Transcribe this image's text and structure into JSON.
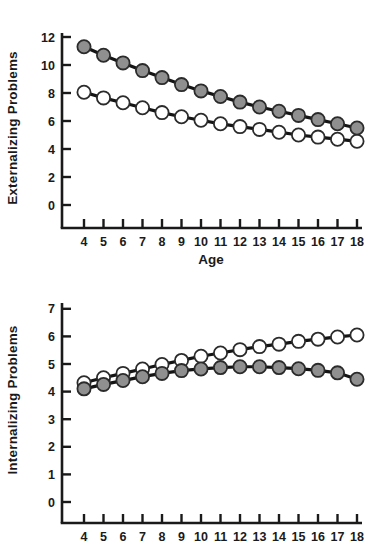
{
  "figure": {
    "background": "#ffffff"
  },
  "colors": {
    "axis": "#1a1a1a",
    "line": "#141414",
    "marker_stroke": "#2b2b2b",
    "open_fill": "#ffffff",
    "filled_fill": "#8f8f8f",
    "text": "#1a1a1a"
  },
  "chart_data": [
    {
      "type": "line",
      "title": "",
      "ylabel": "Externalizing Problems",
      "xlabel": "Age",
      "x": [
        4,
        5,
        6,
        7,
        8,
        9,
        10,
        11,
        12,
        13,
        14,
        15,
        16,
        17,
        18
      ],
      "y_ticks": [
        0,
        2,
        4,
        6,
        8,
        10,
        12
      ],
      "ylim": [
        0,
        12
      ],
      "grid": false,
      "legend": "none",
      "series": [
        {
          "name": "open-circle-series",
          "marker": "open",
          "values": [
            8.05,
            7.65,
            7.3,
            6.95,
            6.6,
            6.3,
            6.05,
            5.8,
            5.6,
            5.4,
            5.2,
            5.0,
            4.85,
            4.7,
            4.55
          ]
        },
        {
          "name": "filled-circle-series",
          "marker": "filled",
          "values": [
            11.3,
            10.7,
            10.15,
            9.6,
            9.1,
            8.6,
            8.15,
            7.75,
            7.35,
            7.0,
            6.7,
            6.4,
            6.1,
            5.8,
            5.5
          ]
        }
      ]
    },
    {
      "type": "line",
      "title": "",
      "ylabel": "Internalizing Problems",
      "xlabel": "",
      "x": [
        4,
        5,
        6,
        7,
        8,
        9,
        10,
        11,
        12,
        13,
        14,
        15,
        16,
        17,
        18
      ],
      "y_ticks": [
        0,
        1,
        2,
        3,
        4,
        5,
        6,
        7
      ],
      "ylim": [
        0,
        7
      ],
      "grid": false,
      "legend": "none",
      "series": [
        {
          "name": "open-circle-series",
          "marker": "open",
          "values": [
            4.32,
            4.5,
            4.66,
            4.82,
            4.98,
            5.13,
            5.28,
            5.4,
            5.52,
            5.63,
            5.72,
            5.82,
            5.9,
            5.98,
            6.05
          ]
        },
        {
          "name": "filled-circle-series",
          "marker": "filled",
          "values": [
            4.1,
            4.26,
            4.4,
            4.54,
            4.66,
            4.76,
            4.82,
            4.87,
            4.9,
            4.9,
            4.87,
            4.83,
            4.77,
            4.68,
            4.45
          ]
        }
      ]
    }
  ]
}
